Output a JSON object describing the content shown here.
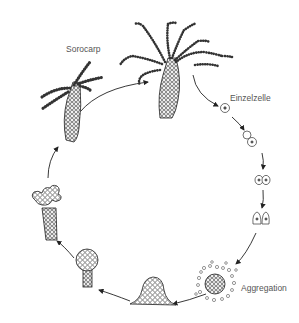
{
  "diagram": {
    "type": "life-cycle",
    "colors": {
      "ink": "#222222",
      "label": "#555555",
      "background": "#ffffff"
    },
    "stages": [
      {
        "id": "fruiting-body-mature",
        "label": ""
      },
      {
        "id": "single-cell",
        "label": "Einzelzelle"
      },
      {
        "id": "cell-division-1",
        "label": ""
      },
      {
        "id": "cell-division-2",
        "label": ""
      },
      {
        "id": "cell-division-3",
        "label": ""
      },
      {
        "id": "aggregation",
        "label": "Aggregation"
      },
      {
        "id": "mound",
        "label": ""
      },
      {
        "id": "early-fruiting-body",
        "label": ""
      },
      {
        "id": "branching-fruiting-body",
        "label": ""
      },
      {
        "id": "sorocarp",
        "label": "Sorocarp"
      }
    ],
    "labels": {
      "sorocarp": "Sorocarp",
      "single_cell": "Einzelzelle",
      "aggregation": "Aggregation"
    },
    "caption": ""
  }
}
